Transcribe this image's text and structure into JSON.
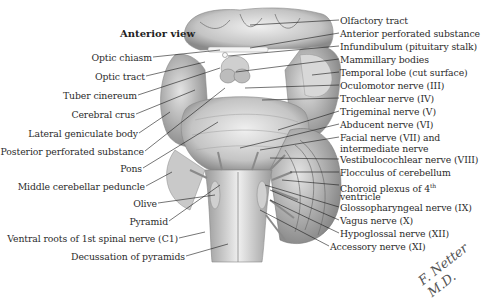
{
  "figure": {
    "title": "Anterior view",
    "signature": "F. Netter M.D."
  },
  "labels_left": [
    {
      "text": "Optic chiasm",
      "x": 152,
      "y": 52
    },
    {
      "text": "Optic tract",
      "x": 145,
      "y": 71
    },
    {
      "text": "Tuber cinereum",
      "x": 137,
      "y": 90
    },
    {
      "text": "Cerebral crus",
      "x": 135,
      "y": 109
    },
    {
      "text": "Lateral geniculate body",
      "x": 138,
      "y": 128
    },
    {
      "text": "Posterior perforated substance",
      "x": 144,
      "y": 146
    },
    {
      "text": "Pons",
      "x": 142,
      "y": 163
    },
    {
      "text": "Middle cerebellar peduncle",
      "x": 145,
      "y": 181
    },
    {
      "text": "Olive",
      "x": 157,
      "y": 198
    },
    {
      "text": "Pyramid",
      "x": 168,
      "y": 216
    },
    {
      "text": "Ventral roots of 1st spinal nerve (C1)",
      "x": 178,
      "y": 233
    },
    {
      "text": "Decussation of pyramids",
      "x": 185,
      "y": 251
    }
  ],
  "labels_right": [
    {
      "text": "Olfactory tract",
      "x": 340,
      "y": 15
    },
    {
      "text": "Anterior perforated substance",
      "x": 340,
      "y": 28
    },
    {
      "text": "Infundibulum (pituitary stalk)",
      "x": 340,
      "y": 41
    },
    {
      "text": "Mammillary bodies",
      "x": 340,
      "y": 54
    },
    {
      "text": "Temporal lobe (cut surface)",
      "x": 340,
      "y": 67
    },
    {
      "text": "Oculomotor nerve (III)",
      "x": 340,
      "y": 80
    },
    {
      "text": "Trochlear nerve (IV)",
      "x": 340,
      "y": 93
    },
    {
      "text": "Trigeminal nerve (V)",
      "x": 340,
      "y": 106
    },
    {
      "text": "Abducent nerve (VI)",
      "x": 340,
      "y": 119
    },
    {
      "text": "Facial nerve (VII) and",
      "x": 340,
      "y": 132
    },
    {
      "text": "intermediate nerve",
      "x": 340,
      "y": 143
    },
    {
      "text": "Vestibulocochlear nerve (VIII)",
      "x": 340,
      "y": 154
    },
    {
      "text": "Flocculus of cerebellum",
      "x": 340,
      "y": 167
    },
    {
      "text": "Choroid plexus of 4",
      "sup": "th",
      "x": 340,
      "y": 180
    },
    {
      "text": "ventricle",
      "x": 340,
      "y": 191
    },
    {
      "text": "Glossopharyngeal nerve (IX)",
      "x": 340,
      "y": 202
    },
    {
      "text": "Vagus nerve (X)",
      "x": 340,
      "y": 215
    },
    {
      "text": "Hypoglossal nerve (XII)",
      "x": 340,
      "y": 228
    },
    {
      "text": "Accessory nerve (XI)",
      "x": 330,
      "y": 241
    }
  ],
  "colors": {
    "background": "#ffffff",
    "tissue_light": "#e6e6e6",
    "tissue_mid": "#bdbdbd",
    "tissue_dark": "#7a7a7a",
    "leader_line": "#1a1a1a",
    "text": "#2b2b2b"
  }
}
